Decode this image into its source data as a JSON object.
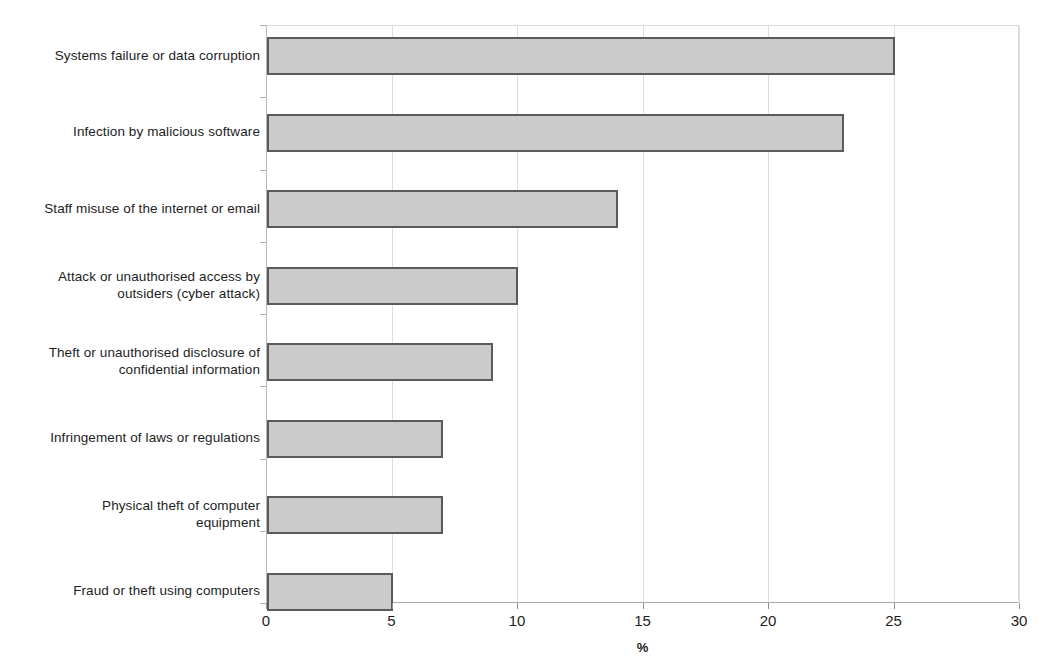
{
  "chart_data": {
    "type": "bar",
    "orientation": "horizontal",
    "title": "",
    "xlabel": "%",
    "ylabel": "",
    "xlim": [
      0,
      30
    ],
    "xticks": [
      0,
      5,
      10,
      15,
      20,
      25,
      30
    ],
    "grid": true,
    "legend": "none",
    "bar_fill_color": "#cbcbcb",
    "bar_border_color": "#5a5a5a",
    "categories": [
      "Systems failure or data corruption",
      "Infection by malicious software",
      "Staff misuse of the internet or email",
      "Attack or unauthorised access by outsiders (cyber attack)",
      "Theft or unauthorised disclosure of confidential information",
      "Infringement of laws or regulations",
      "Physical theft of computer equipment",
      "Fraud or theft using computers"
    ],
    "values": [
      25,
      23,
      14,
      10,
      9,
      7,
      7,
      5
    ],
    "series": [
      {
        "name": "",
        "values": [
          25,
          23,
          14,
          10,
          9,
          7,
          7,
          5
        ]
      }
    ]
  },
  "axis": {
    "x_tick_labels": [
      "0",
      "5",
      "10",
      "15",
      "20",
      "25",
      "30"
    ],
    "x_axis_title": "%"
  },
  "bar_labels": [
    {
      "line1": "Systems failure or data corruption",
      "line2": ""
    },
    {
      "line1": "Infection by malicious software",
      "line2": ""
    },
    {
      "line1": "Staff misuse of the internet or email",
      "line2": ""
    },
    {
      "line1": "Attack or unauthorised access by",
      "line2": "outsiders (cyber attack)"
    },
    {
      "line1": "Theft or unauthorised disclosure of",
      "line2": "confidential information"
    },
    {
      "line1": "Infringement of laws or regulations",
      "line2": ""
    },
    {
      "line1": "Physical theft of computer",
      "line2": "equipment"
    },
    {
      "line1": "Fraud or theft using computers",
      "line2": ""
    }
  ]
}
